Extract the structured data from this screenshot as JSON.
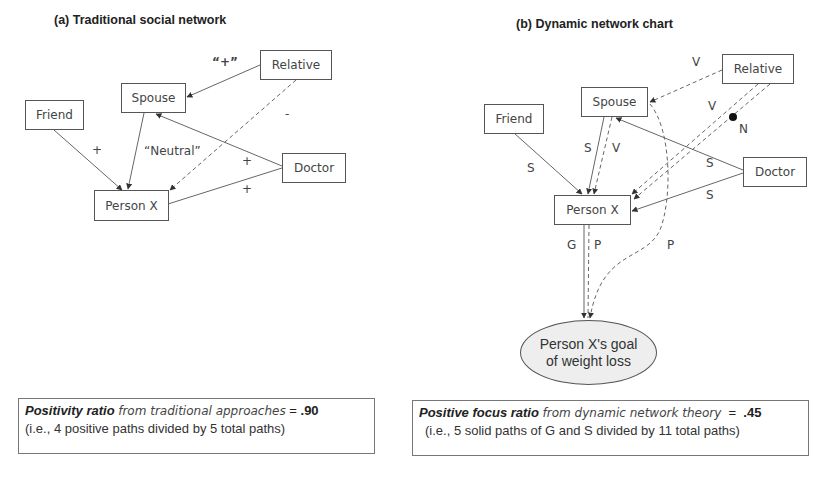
{
  "panel_a": {
    "title": "(a) Traditional social network",
    "nodes": {
      "friend": "Friend",
      "spouse": "Spouse",
      "relative": "Relative",
      "doctor": "Doctor",
      "person_x": "Person X"
    },
    "edge_labels": {
      "relative_to_spouse": "“+”",
      "relative_to_person": "-",
      "friend_to_person": "+",
      "spouse_to_person": "“Neutral”",
      "doctor_to_spouse": "+",
      "doctor_to_person": "+"
    },
    "edges": [
      {
        "from": "Relative",
        "to": "Spouse",
        "style": "solid",
        "label": "“+”"
      },
      {
        "from": "Relative",
        "to": "Person X",
        "style": "dashed",
        "label": "-"
      },
      {
        "from": "Friend",
        "to": "Person X",
        "style": "solid",
        "label": "+"
      },
      {
        "from": "Spouse",
        "to": "Person X",
        "style": "solid",
        "label": "“Neutral”"
      },
      {
        "from": "Doctor",
        "to": "Spouse",
        "style": "solid",
        "label": "+"
      },
      {
        "from": "Doctor",
        "to": "Person X",
        "style": "solid",
        "label": "+"
      }
    ],
    "summary": {
      "title": "Positivity ratio",
      "subtitle": "from traditional approaches",
      "equals": " = ",
      "value": ".90",
      "detail": "(i.e., 4 positive paths divided by 5 total paths)"
    }
  },
  "panel_b": {
    "title": "(b) Dynamic network chart",
    "nodes": {
      "friend": "Friend",
      "spouse": "Spouse",
      "relative": "Relative",
      "doctor": "Doctor",
      "person_x": "Person X",
      "goal_line1": "Person X's goal",
      "goal_line2": "of weight loss"
    },
    "edge_labels": {
      "relative_to_spouse": "V",
      "relative_to_person_v": "V",
      "relative_to_person_n": "N",
      "friend_to_person": "S",
      "spouse_to_person_s": "S",
      "spouse_to_person_v": "V",
      "doctor_to_spouse": "S",
      "doctor_to_person": "S",
      "person_to_goal_g": "G",
      "person_to_goal_p": "P",
      "spouse_to_goal_p": "P"
    },
    "edges": [
      {
        "from": "Relative",
        "to": "Spouse",
        "style": "dashed",
        "label": "V"
      },
      {
        "from": "Relative",
        "to": "Person X",
        "style": "dashed",
        "label": "V"
      },
      {
        "from": "Relative",
        "to": "Person X",
        "style": "dashed",
        "label": "N"
      },
      {
        "from": "Friend",
        "to": "Person X",
        "style": "solid",
        "label": "S"
      },
      {
        "from": "Spouse",
        "to": "Person X",
        "style": "solid",
        "label": "S"
      },
      {
        "from": "Spouse",
        "to": "Person X",
        "style": "dashed",
        "label": "V"
      },
      {
        "from": "Doctor",
        "to": "Spouse",
        "style": "solid",
        "label": "S"
      },
      {
        "from": "Doctor",
        "to": "Person X",
        "style": "solid",
        "label": "S"
      },
      {
        "from": "Person X",
        "to": "Person X's goal of weight loss",
        "style": "solid",
        "label": "G"
      },
      {
        "from": "Person X",
        "to": "Person X's goal of weight loss",
        "style": "dashed",
        "label": "P"
      },
      {
        "from": "Spouse",
        "to": "Person X's goal of weight loss",
        "style": "dashed",
        "label": "P"
      }
    ],
    "summary": {
      "title": "Positive focus ratio",
      "subtitle": "from dynamic network theory",
      "equals": "  =  ",
      "value": ".45",
      "detail": "(i.e., 5 solid paths of G and S divided by 11 total paths)"
    }
  },
  "colors": {
    "line": "#555555",
    "node_border": "#555555",
    "goal_fill": "#eeeeee",
    "text": "#333333"
  }
}
